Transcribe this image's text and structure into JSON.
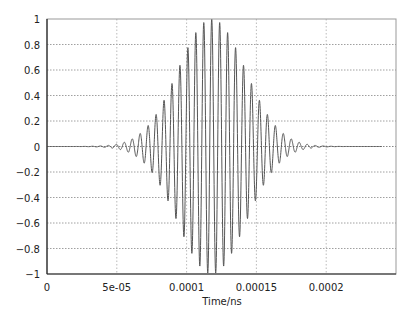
{
  "chart_data": {
    "type": "line",
    "title": "",
    "xlabel": "Time/ns",
    "ylabel": "",
    "xlim": [
      0,
      0.00025
    ],
    "ylim": [
      -1,
      1
    ],
    "grid": true,
    "legend": null,
    "x_ticks": [
      0,
      5e-05,
      0.0001,
      0.00015,
      0.0002
    ],
    "x_tick_labels": [
      "0",
      "5e-05",
      "0.0001",
      "0.00015",
      "0.0002"
    ],
    "y_ticks": [
      1,
      0.8,
      0.6,
      0.4,
      0.2,
      0,
      -0.2,
      -0.4,
      -0.6,
      -0.8,
      -1
    ],
    "y_tick_labels": [
      "1",
      "0.8",
      "0.6",
      "0.4",
      "0.2",
      "0",
      "−0.2",
      "−0.4",
      "−0.6",
      "−0.8",
      "−1"
    ],
    "series": [
      {
        "name": "signal",
        "description": "Gaussian-modulated sinusoidal pulse",
        "color": "#555555",
        "x_start": 0,
        "x_end": 0.00024,
        "envelope_center": 0.000118,
        "envelope_sigma": 2.4e-05,
        "carrier_period": 5.7e-06,
        "amplitude": 1.0,
        "peak_samples": {
          "x": [
            6e-05,
            7e-05,
            8e-05,
            9e-05,
            0.0001,
            0.00011,
            0.000118,
            0.00013,
            0.00014,
            0.00015,
            0.00016,
            0.00017,
            0.00018
          ],
          "y": [
            0.05,
            0.12,
            0.28,
            0.5,
            0.72,
            0.93,
            1.0,
            0.88,
            0.68,
            0.45,
            0.25,
            0.1,
            0.04
          ]
        }
      }
    ]
  }
}
